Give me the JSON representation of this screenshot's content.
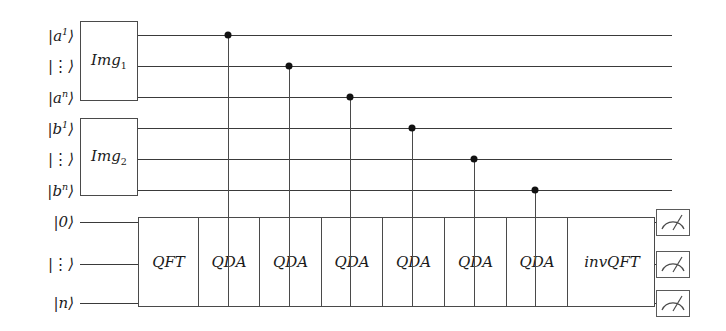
{
  "figure": {
    "type": "quantum-circuit-diagram",
    "width": 726,
    "height": 331,
    "background_color": "#ffffff",
    "line_color": "#3a3a3a",
    "dot_color": "#111111"
  },
  "registers": [
    {
      "id": "a1",
      "label_html": "|a<sup>1</sup>⟩",
      "y": 35
    },
    {
      "id": "adots",
      "label_html": "|⋮⟩",
      "y": 66
    },
    {
      "id": "an",
      "label_html": "|a<sup>n</sup>⟩",
      "y": 97
    },
    {
      "id": "b1",
      "label_html": "|b<sup>1</sup>⟩",
      "y": 128
    },
    {
      "id": "bdots",
      "label_html": "|⋮⟩",
      "y": 159
    },
    {
      "id": "bn",
      "label_html": "|b<sup>n</sup>⟩",
      "y": 190
    },
    {
      "id": "q0",
      "label_html": "|0⟩",
      "y": 222
    },
    {
      "id": "qdots",
      "label_html": "|⋮⟩",
      "y": 264
    },
    {
      "id": "qn",
      "label_html": "|n⟩",
      "y": 303
    }
  ],
  "input_boxes": [
    {
      "id": "img1",
      "label_html": "Img<sub>1</sub>",
      "x": 80,
      "y": 21,
      "w": 58,
      "h": 80
    },
    {
      "id": "img2",
      "label_html": "Img<sub>2</sub>",
      "x": 80,
      "y": 118,
      "w": 58,
      "h": 78
    }
  ],
  "operation_block": {
    "x": 138,
    "y": 217,
    "w": 517,
    "h": 90,
    "cells": [
      {
        "id": "qft",
        "label": "QFT",
        "x": 0,
        "w": 59
      },
      {
        "id": "qda-1",
        "label": "QDA",
        "x": 59,
        "w": 61
      },
      {
        "id": "qda-2",
        "label": "QDA",
        "x": 120,
        "w": 62
      },
      {
        "id": "qda-3",
        "label": "QDA",
        "x": 182,
        "w": 61
      },
      {
        "id": "qda-4",
        "label": "QDA",
        "x": 243,
        "w": 62
      },
      {
        "id": "qda-5",
        "label": "QDA",
        "x": 305,
        "w": 62
      },
      {
        "id": "qda-6",
        "label": "QDA",
        "x": 367,
        "w": 61
      },
      {
        "id": "invqft",
        "label": "invQFT",
        "x": 428,
        "w": 89
      }
    ]
  },
  "controls": [
    {
      "id": "ctrl-1",
      "source_register": "a1",
      "target_cell": "qda-1",
      "x": 228,
      "y": 35
    },
    {
      "id": "ctrl-2",
      "source_register": "adots",
      "target_cell": "qda-2",
      "x": 289,
      "y": 66
    },
    {
      "id": "ctrl-3",
      "source_register": "an",
      "target_cell": "qda-3",
      "x": 350,
      "y": 97
    },
    {
      "id": "ctrl-4",
      "source_register": "b1",
      "target_cell": "qda-4",
      "x": 412,
      "y": 128
    },
    {
      "id": "ctrl-5",
      "source_register": "bdots",
      "target_cell": "qda-5",
      "x": 474,
      "y": 159
    },
    {
      "id": "ctrl-6",
      "source_register": "bn",
      "target_cell": "qda-6",
      "x": 535,
      "y": 190
    }
  ],
  "measurements": [
    {
      "id": "meter-1",
      "icon": "measurement-meter-icon",
      "y": 222
    },
    {
      "id": "meter-2",
      "icon": "measurement-meter-icon",
      "y": 264
    },
    {
      "id": "meter-3",
      "icon": "measurement-meter-icon",
      "y": 303
    }
  ],
  "geometry": {
    "label_right_x": 74,
    "wire_start_x": 80,
    "wire_end_x": 672,
    "top_wire_start_x": 138,
    "meter_x": 656,
    "meter_w": 34,
    "meter_h": 27
  }
}
